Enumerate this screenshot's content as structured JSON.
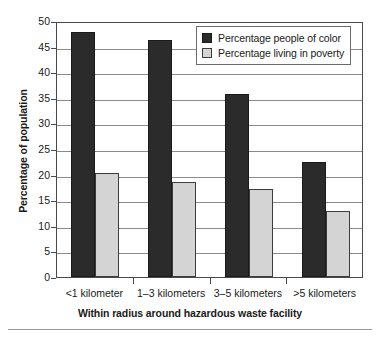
{
  "chart_data": {
    "type": "bar",
    "title": "",
    "xlabel": "Within radius around hazardous waste facility",
    "ylabel": "Percentage of population",
    "categories": [
      "<1 kilometer",
      "1–3 kilometers",
      "3–5 kilometers",
      ">5 kilometers"
    ],
    "series": [
      {
        "name": "Percentage people of color",
        "color": "#2b2b2b",
        "values": [
          47.8,
          46.2,
          35.8,
          22.5
        ]
      },
      {
        "name": "Percentage living in poverty",
        "color": "#d4d4d4",
        "values": [
          20.3,
          18.6,
          17.1,
          12.9
        ]
      }
    ],
    "ylim": [
      0,
      50
    ],
    "ytick_labels": [
      "0",
      "5",
      "10",
      "15",
      "20",
      "25",
      "30",
      "35",
      "40",
      "45",
      "50"
    ],
    "ytick_values": [
      0,
      5,
      10,
      15,
      20,
      25,
      30,
      35,
      40,
      45,
      50
    ],
    "grid": true,
    "legend_position": "top-right"
  },
  "legend": {
    "items": [
      {
        "label": "Percentage people of color",
        "swatch": "dark"
      },
      {
        "label": "Percentage living in poverty",
        "swatch": "light"
      }
    ]
  }
}
